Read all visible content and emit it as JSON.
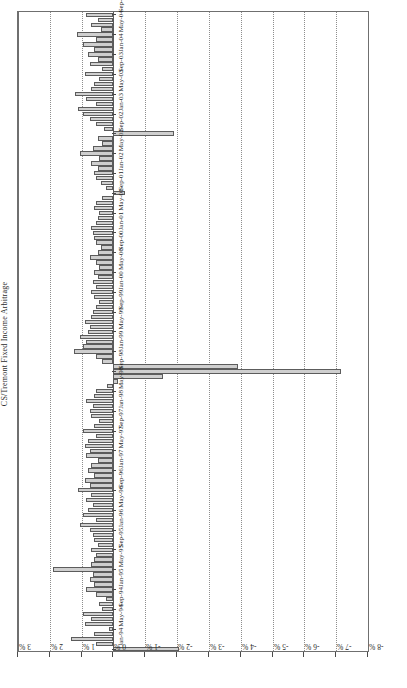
{
  "figure": {
    "title": "CS/Tremont Fixed Income Arbitrage",
    "orientation": "rotated-90-ccw",
    "background": "#ffffff",
    "bar_fill": "#cfcfcf",
    "bar_stroke": "#5c5c5c",
    "grid_color": "#8d8d8d",
    "axis_color": "#6f6f6f"
  },
  "chart_data": {
    "type": "bar",
    "title": "CS/Tremont Fixed Income Arbitrage",
    "xlabel": "",
    "ylabel": "",
    "orientation": "horizontal",
    "grid": true,
    "legend": null,
    "value_axis": {
      "unit": "%",
      "ticks": [
        "3 %",
        "2 %",
        "1 %",
        "0 %",
        "-1 %",
        "-2 %",
        "-3 %",
        "-4 %",
        "-5 %",
        "-6 %",
        "-7 %",
        "-8 %"
      ],
      "tick_values": [
        3,
        2,
        1,
        0,
        -1,
        -2,
        -3,
        -4,
        -5,
        -6,
        -7,
        -8
      ],
      "min": -8,
      "max": 3,
      "direction": "decreasing"
    },
    "category_axis": {
      "label_every": 4,
      "labels": [
        "Jan-94",
        "May-94",
        "Sep-94",
        "Jan-95",
        "May-95",
        "Sep-95",
        "Jan-96",
        "May-96",
        "Sep-96",
        "Jan-97",
        "May-97",
        "Sep-97",
        "Jan-98",
        "May-98",
        "Sep-98",
        "Jan-99",
        "May-99",
        "Sep-99",
        "Jan-00",
        "May-00",
        "Sep-00",
        "Jan-01",
        "May-01",
        "Sep-01",
        "Jan-02",
        "May-02",
        "Sep-02",
        "Jan-03",
        "May-03",
        "Sep-03",
        "Jan-04",
        "May-04",
        "Sep-04"
      ]
    },
    "categories": [
      "Jan-94",
      "Feb-94",
      "Mar-94",
      "Apr-94",
      "May-94",
      "Jun-94",
      "Jul-94",
      "Aug-94",
      "Sep-94",
      "Oct-94",
      "Nov-94",
      "Dec-94",
      "Jan-95",
      "Feb-95",
      "Mar-95",
      "Apr-95",
      "May-95",
      "Jun-95",
      "Jul-95",
      "Aug-95",
      "Sep-95",
      "Oct-95",
      "Nov-95",
      "Dec-95",
      "Jan-96",
      "Feb-96",
      "Mar-96",
      "Apr-96",
      "May-96",
      "Jun-96",
      "Jul-96",
      "Aug-96",
      "Sep-96",
      "Oct-96",
      "Nov-96",
      "Dec-96",
      "Jan-97",
      "Feb-97",
      "Mar-97",
      "Apr-97",
      "May-97",
      "Jun-97",
      "Jul-97",
      "Aug-97",
      "Sep-97",
      "Oct-97",
      "Nov-97",
      "Dec-97",
      "Jan-98",
      "Feb-98",
      "Mar-98",
      "Apr-98",
      "May-98",
      "Jun-98",
      "Jul-98",
      "Aug-98",
      "Sep-98",
      "Oct-98",
      "Nov-98",
      "Dec-98",
      "Jan-99",
      "Feb-99",
      "Mar-99",
      "Apr-99",
      "May-99",
      "Jun-99",
      "Jul-99",
      "Aug-99",
      "Sep-99",
      "Oct-99",
      "Nov-99",
      "Dec-99",
      "Jan-00",
      "Feb-00",
      "Mar-00",
      "Apr-00",
      "May-00",
      "Jun-00",
      "Jul-00",
      "Aug-00",
      "Sep-00",
      "Oct-00",
      "Nov-00",
      "Dec-00",
      "Jan-01",
      "Feb-01",
      "Mar-01",
      "Apr-01",
      "May-01",
      "Jun-01",
      "Jul-01",
      "Aug-01",
      "Sep-01",
      "Oct-01",
      "Nov-01",
      "Dec-01",
      "Jan-02",
      "Feb-02",
      "Mar-02",
      "Apr-02",
      "May-02",
      "Jun-02",
      "Jul-02",
      "Aug-02",
      "Sep-02",
      "Oct-02",
      "Nov-02",
      "Dec-02",
      "Jan-03",
      "Feb-03",
      "Mar-03",
      "Apr-03",
      "May-03",
      "Jun-03",
      "Jul-03",
      "Aug-03",
      "Sep-03",
      "Oct-03",
      "Nov-03",
      "Dec-03",
      "Jan-04",
      "Feb-04",
      "Mar-04",
      "Apr-04",
      "May-04",
      "Jun-04",
      "Jul-04",
      "Aug-04",
      "Sep-04"
    ],
    "values": [
      -2.05,
      0.55,
      1.35,
      0.6,
      0.15,
      0.9,
      0.7,
      0.95,
      0.35,
      0.45,
      0.25,
      0.55,
      0.85,
      0.6,
      0.75,
      0.65,
      1.9,
      0.7,
      0.6,
      0.55,
      0.7,
      0.5,
      0.6,
      0.65,
      0.75,
      1.05,
      0.55,
      0.95,
      0.8,
      0.65,
      0.85,
      0.7,
      1.1,
      0.75,
      0.9,
      0.6,
      0.8,
      0.7,
      0.5,
      0.85,
      0.75,
      0.9,
      0.8,
      0.55,
      0.95,
      0.6,
      0.45,
      0.7,
      0.75,
      0.65,
      0.85,
      0.6,
      0.55,
      0.2,
      -0.15,
      -1.55,
      -7.15,
      -3.9,
      0.35,
      0.55,
      1.25,
      0.95,
      0.85,
      1.05,
      0.8,
      0.75,
      0.9,
      0.7,
      0.65,
      0.55,
      0.45,
      0.6,
      0.7,
      0.55,
      0.65,
      0.5,
      0.6,
      0.45,
      0.55,
      0.75,
      0.5,
      0.4,
      0.55,
      0.6,
      0.65,
      0.7,
      0.55,
      0.5,
      0.45,
      0.6,
      0.55,
      0.35,
      -0.35,
      0.25,
      0.4,
      0.55,
      0.6,
      0.5,
      0.7,
      0.45,
      1.05,
      0.65,
      0.35,
      0.5,
      -1.9,
      0.3,
      0.55,
      0.75,
      0.95,
      1.1,
      0.55,
      0.85,
      1.2,
      0.7,
      0.6,
      0.45,
      0.9,
      0.35,
      0.75,
      0.5,
      0.8,
      0.6,
      0.95,
      0.55,
      1.15,
      0.4,
      0.7,
      0.5,
      0.85
    ]
  }
}
